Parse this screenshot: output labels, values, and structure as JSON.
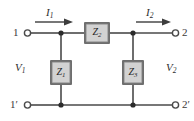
{
  "figure": {
    "kind": "two-port-network-schematic",
    "background_color": "#ffffff",
    "wire_color": "#4a4a4a",
    "box_fill_color": "#d2d2d2",
    "box_border_color": "#6e6e6e",
    "label_color": "#2e2e2e"
  },
  "terminals": {
    "top_left": {
      "label": "1",
      "marker": "open-circle"
    },
    "top_right": {
      "label": "2",
      "marker": "open-circle"
    },
    "bottom_left": {
      "label": "1′",
      "marker": "open-circle"
    },
    "bottom_right": {
      "label": "2′",
      "marker": "open-circle"
    }
  },
  "currents": [
    {
      "name": "I1",
      "base": "I",
      "subscript": "1",
      "direction": "right",
      "side": "input"
    },
    {
      "name": "I2",
      "base": "I",
      "subscript": "2",
      "direction": "right",
      "side": "output"
    }
  ],
  "voltages": [
    {
      "name": "V1",
      "base": "V",
      "subscript": "1",
      "side": "input"
    },
    {
      "name": "V2",
      "base": "V",
      "subscript": "2",
      "side": "output"
    }
  ],
  "impedances": [
    {
      "name": "Z1",
      "base": "Z",
      "subscript": "1",
      "orientation": "vertical",
      "role": "shunt-left"
    },
    {
      "name": "Z2",
      "base": "Z",
      "subscript": "2",
      "orientation": "horizontal",
      "role": "series-top"
    },
    {
      "name": "Z3",
      "base": "Z",
      "subscript": "3",
      "orientation": "vertical",
      "role": "shunt-right"
    }
  ],
  "nodes": [
    {
      "name": "top-left-junction"
    },
    {
      "name": "top-right-junction"
    },
    {
      "name": "bottom-left-junction"
    },
    {
      "name": "bottom-right-junction"
    }
  ]
}
